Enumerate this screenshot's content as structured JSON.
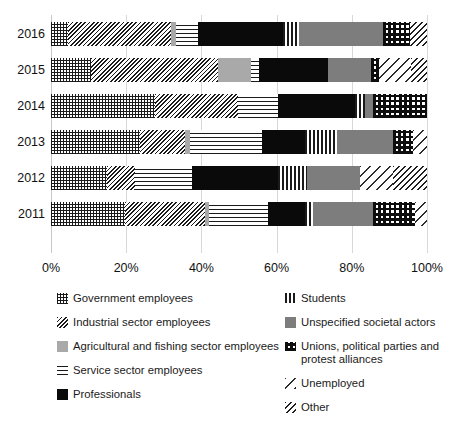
{
  "chart_data": {
    "type": "bar",
    "orientation": "horizontal",
    "stacked": true,
    "normalized_percent": true,
    "title": "",
    "subtitle": "",
    "xlabel": "",
    "ylabel": "",
    "xlim": [
      0,
      100
    ],
    "xticks": [
      "0%",
      "20%",
      "40%",
      "60%",
      "80%",
      "100%"
    ],
    "xtick_values": [
      0,
      20,
      40,
      60,
      80,
      100
    ],
    "grid": true,
    "grid_axis": "x",
    "legend_position": "below",
    "categories": [
      "2016",
      "2015",
      "2014",
      "2013",
      "2012",
      "2011"
    ],
    "series": [
      {
        "name": "Government employees",
        "pattern": "grid",
        "values": [
          4.5,
          10.6,
          27.7,
          23.7,
          14.9,
          19.7
        ]
      },
      {
        "name": "Industrial sector employees",
        "pattern": "dense-diagonal",
        "values": [
          27.4,
          33.8,
          22.1,
          12.0,
          7.4,
          21.3
        ]
      },
      {
        "name": "Agricultural and fishing sector employees",
        "pattern": "light-gray-solid",
        "values": [
          1.3,
          8.8,
          0.0,
          1.3,
          0.0,
          1.1
        ]
      },
      {
        "name": "Service sector employees",
        "pattern": "horizontal-lines",
        "values": [
          5.9,
          2.1,
          10.6,
          19.2,
          15.2,
          15.7
        ]
      },
      {
        "name": "Professionals",
        "pattern": "solid-black",
        "values": [
          22.6,
          18.4,
          20.5,
          11.4,
          22.9,
          9.8
        ]
      },
      {
        "name": "Students",
        "pattern": "vertical-lines",
        "values": [
          4.3,
          0.0,
          2.7,
          8.5,
          7.7,
          2.1
        ]
      },
      {
        "name": "Unspecified societal actors",
        "pattern": "medium-gray-solid",
        "values": [
          22.3,
          11.4,
          2.1,
          14.9,
          14.1,
          16.0
        ]
      },
      {
        "name": "Unions, political parties and protest alliances",
        "pattern": "checkerboard",
        "values": [
          7.2,
          2.1,
          14.3,
          5.3,
          0.0,
          11.2
        ]
      },
      {
        "name": "Unemployed",
        "pattern": "sparse-diagonal",
        "values": [
          0.0,
          8.5,
          0.0,
          3.7,
          8.8,
          3.1
        ]
      },
      {
        "name": "Other",
        "pattern": "medium-diagonal",
        "values": [
          4.5,
          4.3,
          0.0,
          0.0,
          9.0,
          0.0
        ]
      }
    ]
  },
  "legend": {
    "left_column": [
      {
        "label": "Government employees",
        "pattern": "p-grid"
      },
      {
        "label": "Industrial sector employees",
        "pattern": "p-diagdense"
      },
      {
        "label": "Agricultural and fishing sector employees",
        "pattern": "p-lightgray"
      },
      {
        "label": "Service sector employees",
        "pattern": "p-horiz"
      },
      {
        "label": "Professionals",
        "pattern": "p-black"
      }
    ],
    "right_column": [
      {
        "label": "Students",
        "pattern": "p-vert"
      },
      {
        "label": "Unspecified societal actors",
        "pattern": "p-gray"
      },
      {
        "label": "Unions, political parties and protest alliances",
        "pattern": "p-check"
      },
      {
        "label": "Unemployed",
        "pattern": "p-diagsparse"
      },
      {
        "label": "Other",
        "pattern": "p-diagmed"
      }
    ]
  }
}
